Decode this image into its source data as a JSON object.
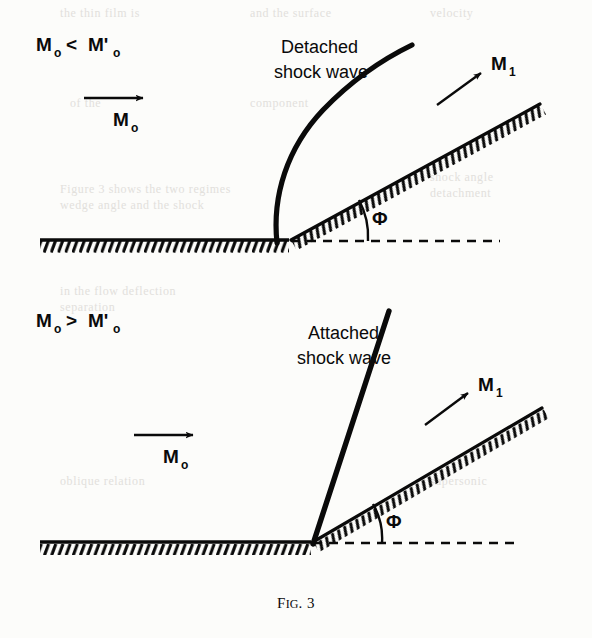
{
  "figure": {
    "caption_prefix": "F",
    "caption_smallcaps": "IG",
    "caption_suffix": ". 3",
    "caption_full": "FIG. 3",
    "background_color": "#fcfcfa",
    "ink_color": "#0a0a0a"
  },
  "panels": [
    {
      "id": "detached",
      "condition_label": "M₀ < M'₀",
      "condition_parts": {
        "m": "M",
        "sub0": "o",
        "operator": "<",
        "mprime": "M'",
        "sub0b": "o"
      },
      "shock_label_line1": "Detached",
      "shock_label_line2": "shock wave",
      "upstream_label": "M",
      "upstream_sub": "o",
      "downstream_label": "M",
      "downstream_sub": "1",
      "angle_label": "Φ",
      "shock_type": "detached-bow-shock",
      "standoff": "shock stands off ahead of the wedge apex"
    },
    {
      "id": "attached",
      "condition_label": "M₀ > M'₀",
      "condition_parts": {
        "m": "M",
        "sub0": "o",
        "operator": ">",
        "mprime": "M'",
        "sub0b": "o"
      },
      "shock_label_line1": "Attached",
      "shock_label_line2": "shock wave",
      "upstream_label": "M",
      "upstream_sub": "o",
      "downstream_label": "M",
      "downstream_sub": "1",
      "angle_label": "Φ",
      "shock_type": "attached-oblique-shock",
      "standoff": "shock attached at the wedge apex"
    }
  ],
  "ghost_text": [
    {
      "text": "the thin film is",
      "x": 60,
      "y": 6
    },
    {
      "text": "and the surface",
      "x": 250,
      "y": 6
    },
    {
      "text": "velocity",
      "x": 430,
      "y": 6
    },
    {
      "text": "of the",
      "x": 70,
      "y": 96
    },
    {
      "text": "component",
      "x": 250,
      "y": 96
    },
    {
      "text": "Figure 3 shows the two regimes",
      "x": 60,
      "y": 182
    },
    {
      "text": "wedge angle and the shock",
      "x": 60,
      "y": 198
    },
    {
      "text": "in the flow deflection",
      "x": 60,
      "y": 284
    },
    {
      "text": "separation",
      "x": 60,
      "y": 300
    },
    {
      "text": "shock angle",
      "x": 430,
      "y": 170
    },
    {
      "text": "detachment",
      "x": 430,
      "y": 186
    },
    {
      "text": "oblique relation",
      "x": 60,
      "y": 474
    },
    {
      "text": "supersonic",
      "x": 430,
      "y": 474
    }
  ]
}
